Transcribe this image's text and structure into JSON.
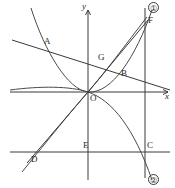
{
  "figure": {
    "width": 175,
    "height": 188,
    "background": "#ffffff",
    "stroke_color": "#3a3a3a",
    "text_color": "#2b2b2b"
  },
  "axes": {
    "x_label": "x",
    "y_label": "y",
    "origin_label": "O",
    "x_axis_y": 92,
    "y_axis_x": 88,
    "x_axis_start": 10,
    "x_axis_end": 170,
    "y_axis_start": 8,
    "y_axis_end": 180
  },
  "points": [
    {
      "id": "A",
      "label": "A",
      "x": 45,
      "y": 44,
      "label_x": 44,
      "label_y": 37
    },
    {
      "id": "B",
      "label": "B",
      "x": 122,
      "y": 76,
      "label_x": 121,
      "label_y": 69
    },
    {
      "id": "C",
      "label": "C",
      "x": 145,
      "y": 152,
      "label_x": 147,
      "label_y": 142
    },
    {
      "id": "D",
      "label": "D",
      "x": 31,
      "y": 152,
      "label_x": 31,
      "label_y": 155
    },
    {
      "id": "E",
      "label": "E",
      "x": 88,
      "y": 152,
      "label_x": 83,
      "label_y": 142
    },
    {
      "id": "F",
      "label": "F",
      "x": 145,
      "y": 21,
      "label_x": 148,
      "label_y": 17
    },
    {
      "id": "G",
      "label": "G",
      "x": 100,
      "y": 62,
      "label_x": 98,
      "label_y": 54
    }
  ],
  "markers": [
    {
      "id": "branch-1",
      "label": "①",
      "x": 150,
      "y": 3
    },
    {
      "id": "branch-2",
      "label": "②",
      "x": 150,
      "y": 174
    }
  ],
  "curves": {
    "parabola_up": "M 34 8 Q 61 130 88 92 Q 115 54 152 10",
    "parabola_down": "M 88 92 Q 120 95 152 180",
    "parabola_right": "M 10 89 Q 72 86 88 92 Q 112 100 146 150",
    "hyperbola_left_lower": "M 18 180 Q 56 130 88 92",
    "chord_line": "M 12 40 L 170 90",
    "ray_OF": "M 88 92 L 146 16",
    "ray_DF": "M 25 166 L 150 12",
    "lower_horizontal": "M 10 152 L 170 152",
    "vertical_right": "M 145 8 L 145 178"
  },
  "geometry_notes": {
    "x_arrow": true,
    "y_arrow": true
  }
}
